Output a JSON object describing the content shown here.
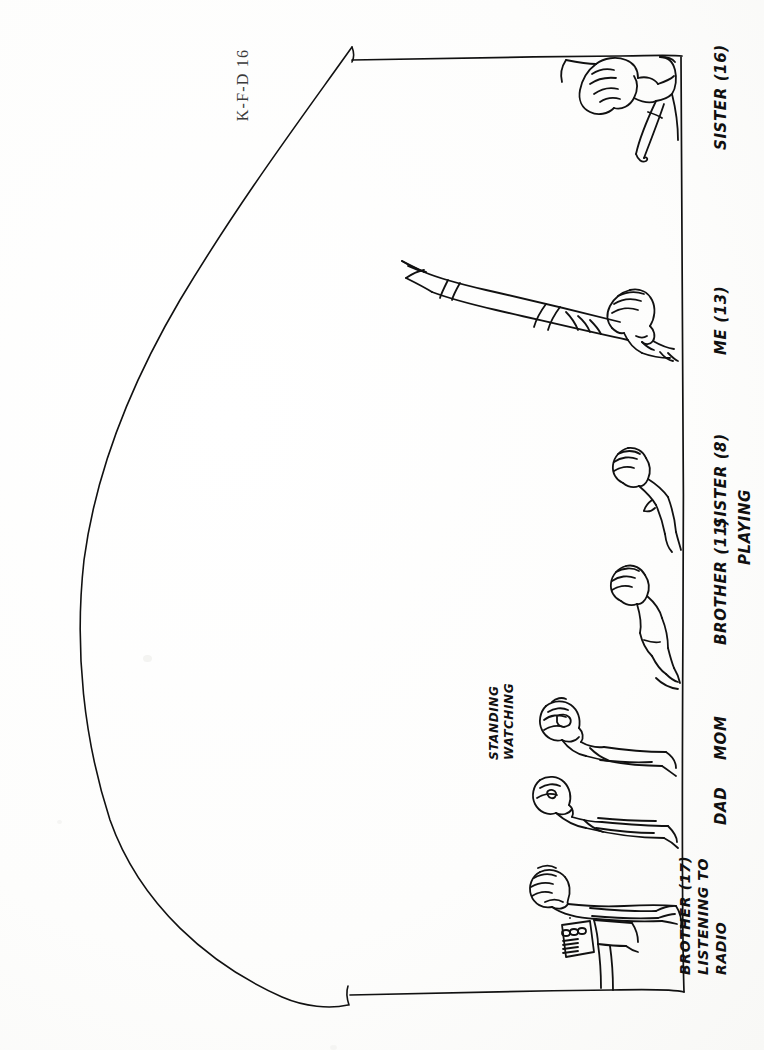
{
  "document": {
    "type": "kinetic-family-drawing-scan",
    "catalog_label": "K-F-D  16",
    "orientation": "landscape-scan-rotated-90",
    "ink_color": "#101010",
    "paper_color": "#fefefd",
    "width": 764,
    "height": 1050
  },
  "annotations": {
    "sister_16": {
      "text": "SISTER (16)"
    },
    "me_13": {
      "text": "ME (13)"
    },
    "sister_8": {
      "text": "SISTER (8)"
    },
    "brother_11": {
      "text": "BROTHER (11)"
    },
    "playing": {
      "text": "PLAYING"
    },
    "mom": {
      "text": "MOM"
    },
    "dad": {
      "text": "DAD"
    },
    "standing_watching_line1": {
      "text": "STANDING"
    },
    "standing_watching_line2": {
      "text": "WATCHING"
    },
    "brother_17_line1": {
      "text": "BROTHER (17)"
    },
    "brother_17_line2": {
      "text": "LISTENING TO"
    },
    "brother_17_line3": {
      "text": "RADIO"
    }
  },
  "figures": [
    {
      "name": "sister-16-figure",
      "label": "SISTER (16)",
      "activity": "leaning"
    },
    {
      "name": "me-13-figure",
      "label": "ME (13)",
      "activity": "arm outstretched"
    },
    {
      "name": "sister-8-figure",
      "label": "SISTER (8)",
      "activity": "PLAYING"
    },
    {
      "name": "brother-11-figure",
      "label": "BROTHER (11)",
      "activity": "PLAYING"
    },
    {
      "name": "mom-figure",
      "label": "MOM",
      "activity": "STANDING WATCHING"
    },
    {
      "name": "dad-figure",
      "label": "DAD",
      "activity": "STANDING WATCHING"
    },
    {
      "name": "brother-17-figure",
      "label": "BROTHER (17)",
      "activity": "LISTENING TO RADIO"
    }
  ],
  "objects": [
    {
      "name": "radio-on-stand",
      "label": "RADIO"
    }
  ]
}
